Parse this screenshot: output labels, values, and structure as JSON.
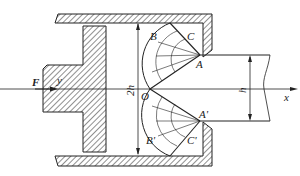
{
  "diagram": {
    "labels": {
      "force": "F",
      "origin": "O",
      "point_a": "A",
      "point_a_prime": "A'",
      "point_b": "B",
      "point_b_prime": "B'",
      "point_c": "C",
      "point_c_prime": "C'",
      "x_axis": "x",
      "y_axis": "y",
      "dim_2h": "2h",
      "dim_h": "h"
    },
    "colors": {
      "line": "#222222",
      "background": "#ffffff"
    }
  }
}
